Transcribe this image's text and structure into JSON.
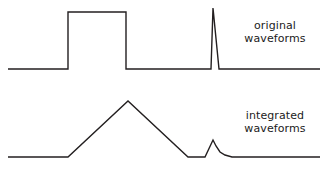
{
  "figure": {
    "title": "",
    "background_color": "#ffffff",
    "stroke_color": "#231f20",
    "text_color": "#1b1b1b"
  },
  "labels": {
    "original": {
      "line1": "original",
      "line2": "waveforms"
    },
    "integrated": {
      "line1": "integrated",
      "line2": "waveforms"
    }
  },
  "chart_data": {
    "type": "line",
    "title": "",
    "xlabel": "",
    "ylabel": "",
    "grid": false,
    "legend_position": "right",
    "xlim": [
      0,
      322
    ],
    "ylim_note": "pixel coordinates, y increases downward",
    "annotations": [
      {
        "text": "original waveforms",
        "x": 275,
        "y": 32
      },
      {
        "text": "integrated waveforms",
        "x": 275,
        "y": 122
      }
    ],
    "series": [
      {
        "name": "original waveforms",
        "description": "baseline with a rectangular pulse and a narrow impulse spike",
        "baseline_y": 69,
        "points": [
          [
            8,
            69
          ],
          [
            68,
            69
          ],
          [
            68,
            12
          ],
          [
            126,
            12
          ],
          [
            126,
            69
          ],
          [
            211,
            69
          ],
          [
            213,
            8
          ],
          [
            219,
            69
          ],
          [
            320,
            69
          ]
        ],
        "features": [
          {
            "kind": "rectangular-pulse",
            "start_x": 68,
            "end_x": 126,
            "top_y": 12,
            "height_px": 57
          },
          {
            "kind": "impulse-spike",
            "rise_x": 211,
            "peak_x": 213,
            "peak_y": 8,
            "fall_x": 219,
            "height_px": 61
          }
        ]
      },
      {
        "name": "integrated waveforms",
        "description": "baseline with a triangular ramp and an exponential-decay bump",
        "baseline_y": 157,
        "points": [
          [
            8,
            157
          ],
          [
            68,
            157
          ],
          [
            128,
            101
          ],
          [
            188,
            157
          ],
          [
            205,
            157
          ],
          [
            213,
            140
          ],
          [
            216,
            146
          ],
          [
            220,
            152
          ],
          [
            225,
            155
          ],
          [
            232,
            157
          ],
          [
            320,
            157
          ]
        ],
        "features": [
          {
            "kind": "triangle",
            "start_x": 68,
            "peak_x": 128,
            "peak_y": 101,
            "end_x": 188,
            "height_px": 56
          },
          {
            "kind": "exponential-decay",
            "start_x": 205,
            "peak_x": 213,
            "peak_y": 140,
            "tail_end_x": 232,
            "height_px": 17
          }
        ]
      }
    ]
  }
}
